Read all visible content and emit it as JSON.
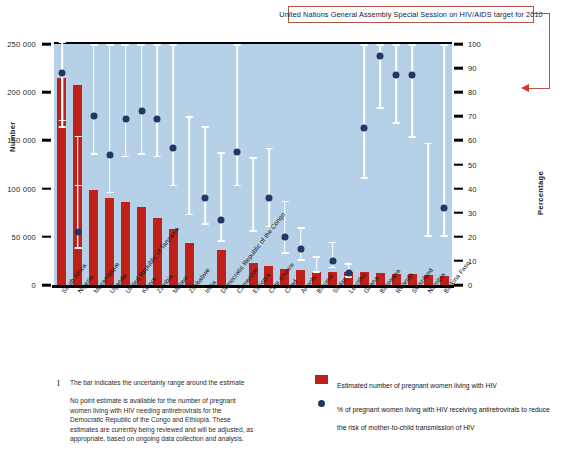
{
  "annotation": {
    "ungass_target_label": "United Nations General Assembly Special Session on HIV/AIDS target for 2010",
    "target_value": 80,
    "arrow_color": "#d9352b",
    "box_border_color": "#b3564a"
  },
  "axes": {
    "left_title": "Number",
    "right_title": "Percentage",
    "left_ticks": [
      "250 000",
      "200 000",
      "150 000",
      "100 000",
      "50 000",
      "0"
    ],
    "left_tick_values": [
      250000,
      200000,
      150000,
      100000,
      50000,
      0
    ],
    "right_ticks": [
      "100",
      "90",
      "80",
      "70",
      "60",
      "50",
      "40",
      "30",
      "20",
      "10",
      "0"
    ],
    "right_tick_values": [
      100,
      90,
      80,
      70,
      60,
      50,
      40,
      30,
      20,
      10,
      0
    ]
  },
  "footnotes": {
    "symbol": "I",
    "line1": "The bar indicates the uncertainty range around the estimate",
    "paragraph": "No point estimate is available for the number of pregnant women living with HIV needing antiretrovirals for the Democratic Republic of the Congo and Ethiopia. These estimates are currently being reviewed and will be adjusted, as appropriate, based on ongoing data collection and analysis."
  },
  "legend": {
    "items": [
      {
        "marker": "bar-swatch",
        "label": "Estimated number of pregnant women living with HIV",
        "color": "#bf2118"
      },
      {
        "marker": "dot-swatch",
        "label": "% of pregnant women living with HIV receiving antiretrovirals to reduce the risk of mother-to-child transmission of HIV",
        "color": "#1f3864"
      }
    ]
  },
  "chart_data": {
    "type": "bar",
    "title": "",
    "xlabel": "",
    "ylabel": "Number",
    "ylabel_secondary": "Percentage",
    "ylim": [
      0,
      250000
    ],
    "ylim_secondary": [
      0,
      100
    ],
    "grid": false,
    "legend_position": "bottom-right",
    "plot_background": "#b6d0e8",
    "bar_color": "#bf2118",
    "dot_color": "#1f3864",
    "whisker_color": "#ffffff",
    "categories": [
      "South Africa",
      "Nigeria",
      "Mozambique",
      "Uganda",
      "United Republic of Tanzania",
      "Kenya",
      "Zambia",
      "Malawi",
      "Zimbabwe",
      "India",
      "Democratic Republic of the Congo",
      "Cameroon",
      "Ethiopia",
      "Côte d'Ivoire",
      "Chad",
      "Angola",
      "Burundi",
      "Sudan",
      "Lesotho",
      "Ghana",
      "Botswana",
      "Rwanda",
      "Swaziland",
      "Namibia",
      "Burkina Faso"
    ],
    "series": [
      {
        "name": "Estimated number of pregnant women living with HIV",
        "axis": "left",
        "type": "bar",
        "values": [
          215000,
          208000,
          99000,
          90000,
          86000,
          81000,
          69000,
          58000,
          44000,
          null,
          36000,
          null,
          23000,
          20000,
          17000,
          16000,
          14000,
          14000,
          13000,
          13000,
          12000,
          11000,
          11000,
          10000,
          9000
        ],
        "uncertainty_low": [
          163000,
          37000,
          null,
          null,
          null,
          null,
          null,
          null,
          null,
          null,
          null,
          null,
          null,
          null,
          null,
          null,
          null,
          null,
          null,
          null,
          null,
          null,
          null,
          null,
          null
        ],
        "uncertainty_high": [
          218000,
          104000,
          null,
          null,
          null,
          null,
          null,
          null,
          null,
          null,
          null,
          null,
          null,
          null,
          null,
          null,
          null,
          null,
          null,
          null,
          null,
          null,
          null,
          null,
          null
        ]
      },
      {
        "name": "% of pregnant women living with HIV receiving antiretrovirals",
        "axis": "right",
        "type": "scatter",
        "values": [
          88,
          22,
          70,
          54,
          69,
          72,
          69,
          57,
          null,
          36,
          27,
          55,
          null,
          36,
          20,
          15,
          null,
          10,
          5,
          65,
          95,
          87,
          87,
          null,
          32
        ],
        "uncertainty_low": [
          68,
          15,
          54,
          38,
          53,
          54,
          53,
          41,
          29,
          25,
          18,
          41,
          22,
          24,
          13,
          10,
          5,
          7,
          3,
          44,
          73,
          67,
          61,
          20,
          20
        ],
        "uncertainty_high": [
          101,
          62,
          100,
          100,
          100,
          100,
          100,
          100,
          70,
          66,
          55,
          100,
          53,
          57,
          35,
          24,
          12,
          18,
          9,
          100,
          100,
          100,
          100,
          59,
          100
        ]
      }
    ]
  }
}
